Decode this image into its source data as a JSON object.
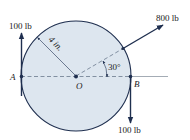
{
  "diagram": {
    "type": "free-body diagram",
    "disk": {
      "center_label": "O",
      "radius_label": "4 in.",
      "fill_color": "#dde6ef",
      "stroke_color": "#1f2f4f"
    },
    "points": {
      "A": "A",
      "B": "B",
      "O": "O"
    },
    "forces": [
      {
        "id": "force-A",
        "label": "100 lb",
        "direction": "up",
        "point": "A"
      },
      {
        "id": "force-800",
        "label": "800 lb",
        "direction": "30° above horizontal",
        "angle_label": "30°"
      },
      {
        "id": "force-B",
        "label": "100 lb",
        "direction": "down",
        "point": "B"
      }
    ],
    "arrow_color": "#1f2f4f",
    "reference_line_color": "#9aa3ad"
  }
}
